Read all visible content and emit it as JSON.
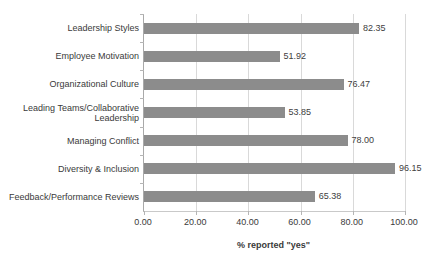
{
  "chart_data": {
    "type": "bar",
    "orientation": "horizontal",
    "title": "",
    "xlabel": "% reported \"yes\"",
    "ylabel": "",
    "xlim": [
      0,
      100
    ],
    "xticks": [
      "0.00",
      "20.00",
      "40.00",
      "60.00",
      "80.00",
      "100.00"
    ],
    "xtick_values": [
      0,
      20,
      40,
      60,
      80,
      100
    ],
    "grid": true,
    "legend": false,
    "bar_color": "#8c8c8c",
    "categories": [
      "Leadership Styles",
      "Employee Motivation",
      "Organizational Culture",
      "Leading Teams/Collaborative Leadership",
      "Managing Conflict",
      "Diversity & Inclusion",
      "Feedback/Performance Reviews"
    ],
    "values": [
      82.35,
      51.92,
      76.47,
      53.85,
      78.0,
      96.15,
      65.38
    ],
    "value_labels": [
      "82.35",
      "51.92",
      "76.47",
      "53.85",
      "78.00",
      "96.15",
      "65.38"
    ]
  }
}
